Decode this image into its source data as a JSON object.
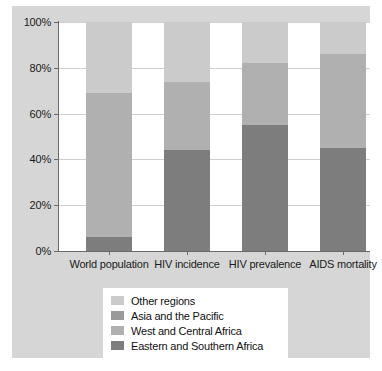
{
  "chart_data": {
    "type": "bar",
    "subtype": "stacked-percentage",
    "title": "",
    "xlabel": "",
    "ylabel": "",
    "ylim": [
      0,
      100
    ],
    "ytick_labels": [
      "0%",
      "20%",
      "40%",
      "60%",
      "80%",
      "100%"
    ],
    "ytick_values": [
      0,
      20,
      40,
      60,
      80,
      100
    ],
    "grid": true,
    "legend_position": "bottom",
    "categories": [
      "World population",
      "HIV incidence",
      "HIV prevalence",
      "AIDS mortality"
    ],
    "series": [
      {
        "name": "Eastern and Southern Africa",
        "color": "#7d7d7d",
        "values": [
          6,
          44,
          55,
          45
        ]
      },
      {
        "name": "West and Central Africa",
        "color": "#b0b0b0",
        "values": [
          63,
          30,
          27,
          41
        ]
      },
      {
        "name": "Asia and the Pacific",
        "color": "#9a9a9a",
        "values": [
          0,
          0,
          0,
          0
        ]
      },
      {
        "name": "Other regions",
        "color": "#cbcbcb",
        "values": [
          31,
          26,
          18,
          14
        ]
      }
    ],
    "legend_entries": [
      {
        "label": "Other regions",
        "color": "#cbcbcb"
      },
      {
        "label": "Asia and the Pacific",
        "color": "#9a9a9a"
      },
      {
        "label": "West and Central Africa",
        "color": "#b0b0b0"
      },
      {
        "label": "Eastern and Southern Africa",
        "color": "#7d7d7d"
      }
    ],
    "stack_boundaries_percent": [
      [
        6,
        69,
        69,
        100
      ],
      [
        44,
        74,
        74,
        100
      ],
      [
        55,
        82,
        82,
        100
      ],
      [
        45,
        86,
        86,
        100
      ]
    ],
    "colors": {
      "plot_background": "#ffffff",
      "figure_background": "#d6d6d6",
      "axis": "#6a6a6a",
      "gridline": "#cfcfcf",
      "text": "#1b1b1b"
    }
  }
}
